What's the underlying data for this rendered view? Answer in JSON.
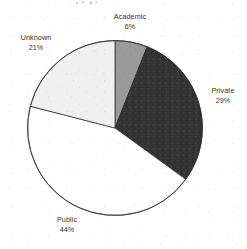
{
  "chart_data": {
    "type": "pie",
    "title": "",
    "categories": [
      "Academic",
      "Private",
      "Public",
      "Unknown"
    ],
    "values": [
      6,
      29,
      44,
      21
    ],
    "value_suffix": "%",
    "total": 100,
    "start_angle_deg": 0,
    "direction": "clockwise",
    "legend": "none",
    "labels_position": "outside",
    "slices": [
      {
        "name": "Academic",
        "value": 6,
        "label": "Academic",
        "value_label": "6%",
        "color": "#9a9a9a",
        "start_deg": 0,
        "end_deg": 21.6
      },
      {
        "name": "Private",
        "value": 29,
        "label": "Private",
        "value_label": "29%",
        "color": "#333333",
        "start_deg": 21.6,
        "end_deg": 126.0
      },
      {
        "name": "Public",
        "value": 44,
        "label": "Public",
        "value_label": "44%",
        "color": "#ffffff",
        "start_deg": 126.0,
        "end_deg": 284.4
      },
      {
        "name": "Unknown",
        "value": 21,
        "label": "Unknown",
        "value_label": "21%",
        "color": "#f0f0f0",
        "start_deg": 284.4,
        "end_deg": 360.0
      }
    ],
    "stroke_color": "#2b2b2b"
  }
}
